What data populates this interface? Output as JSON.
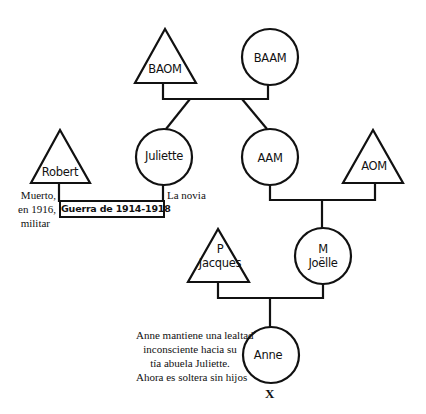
{
  "diagram": {
    "type": "genogram",
    "nodes": [
      {
        "id": "baom",
        "shape": "triangle",
        "label": "BAOM"
      },
      {
        "id": "baam",
        "shape": "circle",
        "label": "BAAM"
      },
      {
        "id": "robert",
        "shape": "triangle",
        "label": "Robert"
      },
      {
        "id": "juliette",
        "shape": "circle",
        "label": "Juliette"
      },
      {
        "id": "aam",
        "shape": "circle",
        "label": "AAM"
      },
      {
        "id": "aom",
        "shape": "triangle",
        "label": "AOM"
      },
      {
        "id": "jacques",
        "shape": "triangle",
        "label_line1": "P",
        "label_line2": "Jacques"
      },
      {
        "id": "joelle",
        "shape": "circle",
        "label_line1": "M",
        "label_line2": "Joëlle"
      },
      {
        "id": "anne",
        "shape": "circle",
        "label": "Anne"
      }
    ],
    "relations": [
      {
        "type": "couple",
        "members": [
          "baom",
          "baam"
        ],
        "children": [
          "juliette",
          "aam"
        ]
      },
      {
        "type": "engaged",
        "members": [
          "robert",
          "juliette"
        ],
        "label": "Guerra de 1914-1918"
      },
      {
        "type": "couple",
        "members": [
          "aam",
          "aom"
        ],
        "children": [
          "joelle"
        ]
      },
      {
        "type": "couple",
        "members": [
          "jacques",
          "joelle"
        ],
        "children": [
          "anne"
        ]
      }
    ],
    "annotations": {
      "robert_note": [
        "Muerto,",
        "en 1916,",
        "militar"
      ],
      "juliette_note": "La novia",
      "war_label": "Guerra de 1914-1918",
      "anne_note": [
        "Anne mantiene una lealtad",
        "inconsciente hacia su",
        "tía abuela Juliette.",
        "Ahora es soltera sin hijos"
      ],
      "anne_marker": "X"
    }
  }
}
